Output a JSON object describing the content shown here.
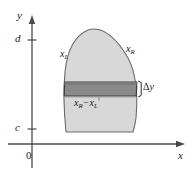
{
  "figure": {
    "kind": "calculus-region-diagram",
    "axes": {
      "y_axis_label": "y",
      "x_axis_label": "x",
      "origin_label": "0",
      "y_ticks": [
        {
          "name": "upper-bound-tick",
          "label": "d",
          "value": "d"
        },
        {
          "name": "lower-bound-tick",
          "label": "c",
          "value": "c"
        }
      ]
    },
    "curves": {
      "left": {
        "label_base": "x",
        "label_sub": "L",
        "text": "xL"
      },
      "right": {
        "label_base": "x",
        "label_sub": "R",
        "text": "xR"
      }
    },
    "slice": {
      "width_label": {
        "left_base": "x",
        "left_sub": "R",
        "operator": "−",
        "right_base": "x",
        "right_sub": "L",
        "text": "xR − xL"
      },
      "thickness_label": {
        "symbol": "Δ",
        "variable": "y",
        "text": "Δy"
      }
    },
    "colors": {
      "region_fill": "#d8d8d8",
      "region_stroke": "#6b6b6b",
      "slice_fill": "#8a8a8a",
      "slice_stroke": "#3d3d3d",
      "axis": "#4a4a4a",
      "text": "#1a1a1a",
      "background": "#ffffff"
    }
  }
}
